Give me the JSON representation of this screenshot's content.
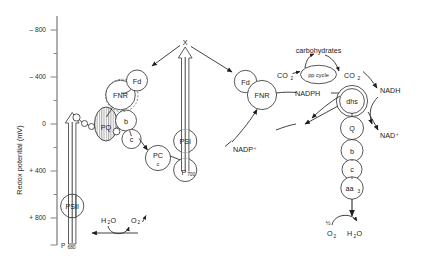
{
  "figure": {
    "type": "diagram",
    "axis": {
      "title": "Redox potential (mV)",
      "ticks": [
        "– 800",
        "– 400",
        "0",
        "+ 400",
        "+ 800"
      ],
      "minor_ticks": 4,
      "bottom_label": "P 680",
      "bottom_label_main": "P",
      "bottom_label_sub": "680"
    },
    "photosystem_ii": {
      "label": "PSII",
      "base_label": "P",
      "base_sub": "680",
      "donor_pair": {
        "left": "H₂O",
        "right": "O₂"
      }
    },
    "photosystem_i": {
      "label": "PSI",
      "base_label": "P",
      "base_sub": "700",
      "acceptor": "X"
    },
    "left_chain": [
      {
        "name": "Ph",
        "label": ""
      },
      {
        "name": "QA",
        "label": ""
      },
      {
        "name": "QB",
        "label": ""
      },
      {
        "name": "PQ",
        "label": "PQ"
      },
      {
        "name": "b",
        "label": "b"
      },
      {
        "name": "c",
        "label": "c"
      },
      {
        "name": "FNR",
        "label": "FNR"
      },
      {
        "name": "Fd",
        "label": "Fd"
      },
      {
        "name": "PC",
        "label": "PC",
        "sub": "c"
      }
    ],
    "right_chain": [
      {
        "name": "Fd",
        "label": "Fd"
      },
      {
        "name": "FNR",
        "label": "FNR"
      },
      {
        "name": "dhs",
        "label": "dhs"
      },
      {
        "name": "Q",
        "label": "Q"
      },
      {
        "name": "b",
        "label": "b"
      },
      {
        "name": "c",
        "label": "c"
      },
      {
        "name": "aa3",
        "label": "aa",
        "sub": "3"
      }
    ],
    "cycle": {
      "label": "pp cycle",
      "product": "carbohydrates",
      "co2_left": "CO₂",
      "co2_right": "CO₂"
    },
    "cofactors": {
      "nadph": "NADPH",
      "nadp_plus": "NADP⁺",
      "nadh": "NADH",
      "nad_plus": "NAD⁺"
    },
    "terminal_oxidase": {
      "substrate_coefficient": "½",
      "substrate": "O₂",
      "product": "H₂O"
    }
  }
}
